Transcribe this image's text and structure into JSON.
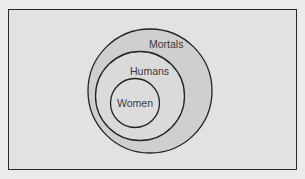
{
  "diagram": {
    "type": "nested-venn",
    "sets": [
      {
        "label": "Mortals",
        "level": 0
      },
      {
        "label": "Humans",
        "level": 1
      },
      {
        "label": "Women",
        "level": 2
      }
    ],
    "colors": {
      "background": "#ebebeb",
      "frame_fill": "#e2e2e2",
      "mortals_fill": "#cfcfcf",
      "humans_fill": "#dadada",
      "women_fill": "#dcdcdc",
      "stroke": "#222222"
    }
  }
}
